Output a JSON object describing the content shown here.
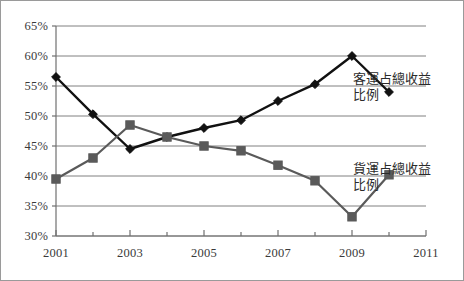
{
  "chart_data": {
    "type": "line",
    "title": "",
    "subtitle": "",
    "xlabel": "",
    "ylabel": "",
    "x": [
      2001,
      2002,
      2003,
      2004,
      2005,
      2006,
      2007,
      2008,
      2009,
      2010
    ],
    "xlim": [
      2001,
      2011
    ],
    "ylim": [
      30,
      65
    ],
    "y_tick_labels": [
      "65%",
      "60%",
      "55%",
      "50%",
      "45%",
      "40%",
      "35%",
      "30%"
    ],
    "y_tick_values": [
      65,
      60,
      55,
      50,
      45,
      40,
      35,
      30
    ],
    "x_tick_labels": [
      "2001",
      "2003",
      "2005",
      "2007",
      "2009",
      "2011"
    ],
    "x_tick_values": [
      2001,
      2003,
      2005,
      2007,
      2009,
      2011
    ],
    "x_minor_ticks": [
      2001,
      2002,
      2003,
      2004,
      2005,
      2006,
      2007,
      2008,
      2009,
      2010,
      2011
    ],
    "grid": "horizontal",
    "legend_position": "inline-annotation",
    "series": [
      {
        "name": "客運占總收益比例",
        "label_line1": "客運占總收益",
        "label_line2": "比例",
        "marker": "diamond",
        "color": "#111111",
        "values": [
          56.5,
          50.3,
          44.5,
          46.5,
          48.0,
          49.3,
          52.5,
          55.3,
          60.0,
          54.0
        ]
      },
      {
        "name": "貨運占總收益比例",
        "label_line1": "貨運占總收益",
        "label_line2": "比例",
        "marker": "square",
        "color": "#5a5a5a",
        "values": [
          39.5,
          43.0,
          48.5,
          46.5,
          45.0,
          44.2,
          41.8,
          39.2,
          33.2,
          40.2
        ]
      }
    ],
    "colors": {
      "passenger_series": "#111111",
      "freight_series": "#5a5a5a",
      "gridline": "#808080",
      "axis": "#707070",
      "border": "#9a9a9a",
      "text": "#3a3a3a"
    }
  }
}
